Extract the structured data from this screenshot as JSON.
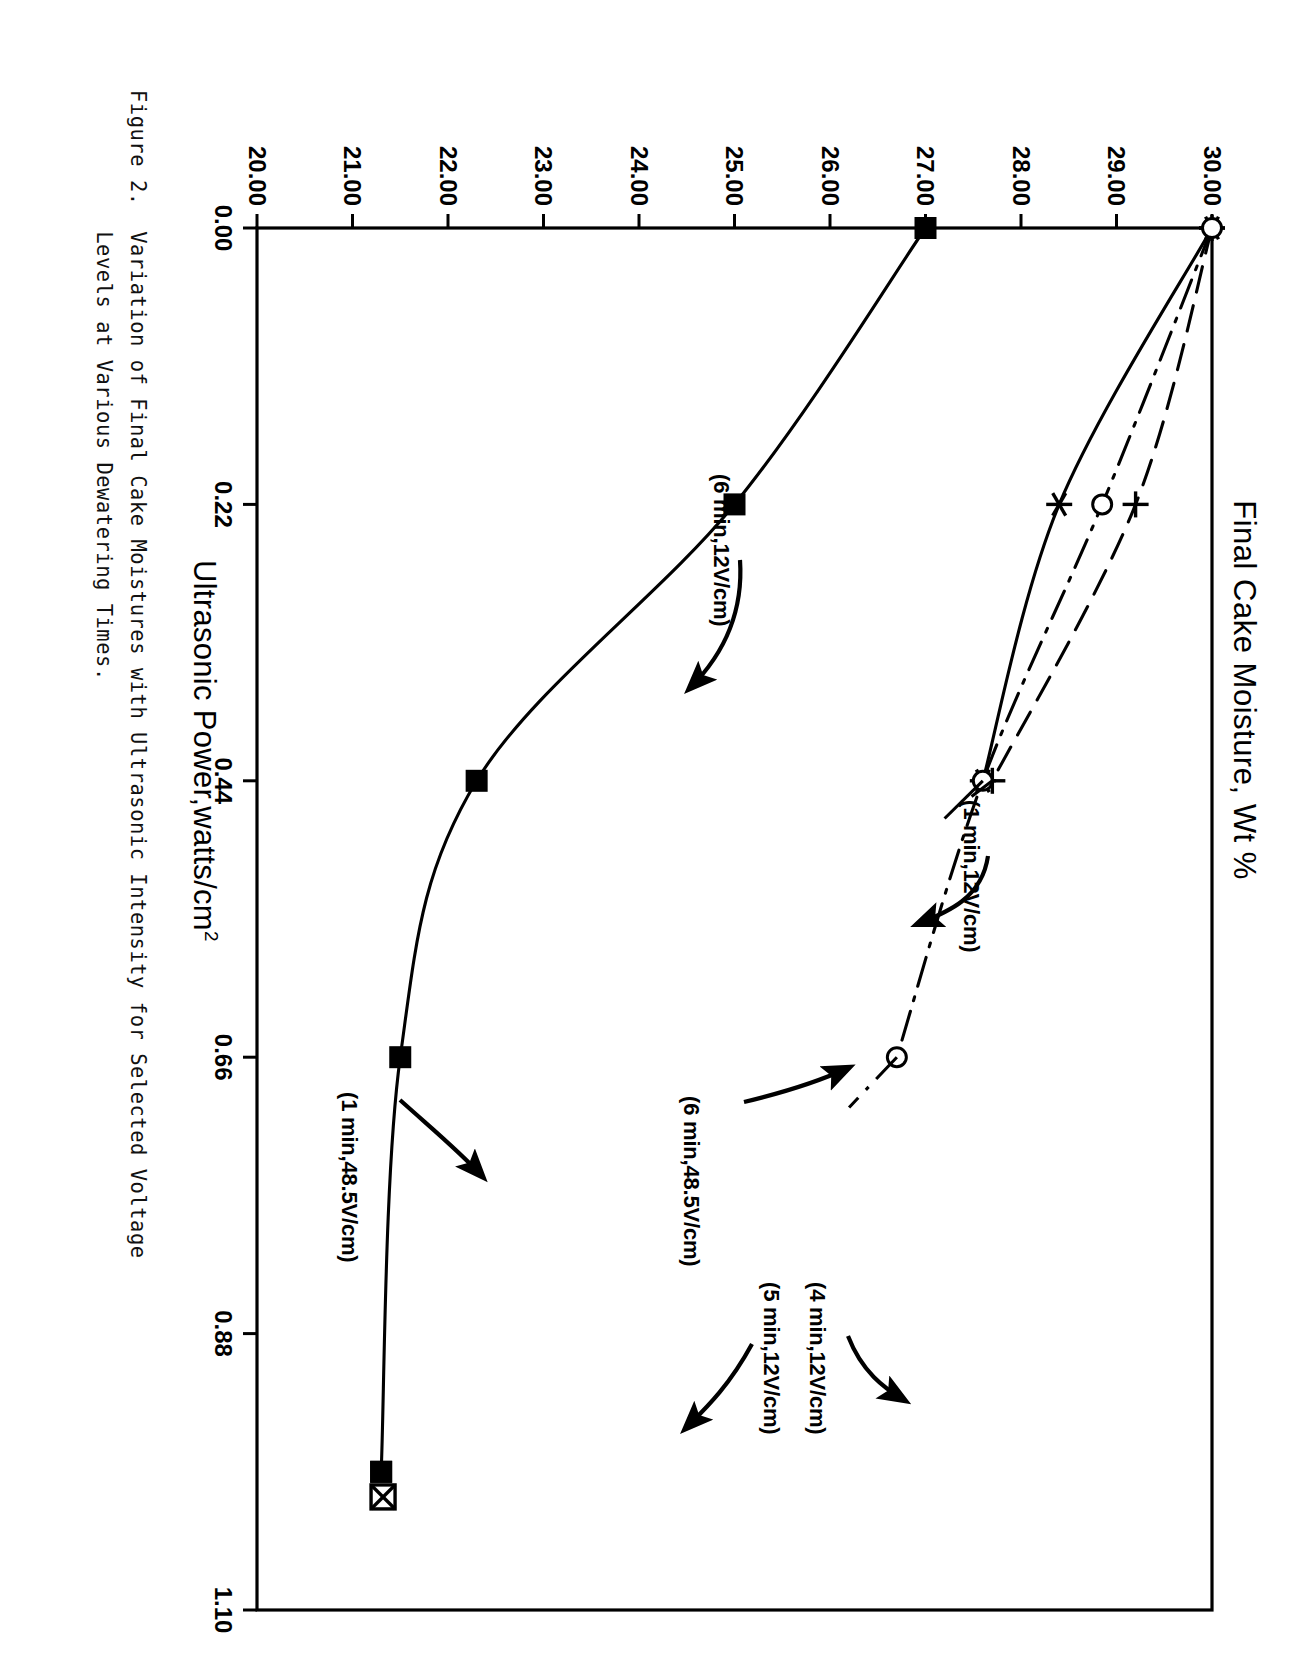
{
  "figure": {
    "caption_line1": "Figure 2.  Variation of Final Cake Moistures with Ultrasonic Intensity for Selected Voltage",
    "caption_line2": "           Levels at Various Dewatering Times."
  },
  "chart_data": {
    "type": "line",
    "title": "Final Cake Moisture, Wt %",
    "xlabel": "Ultrasonic Power,watts/cm",
    "xlabel_sup": "2",
    "ylabel": "Final Cake Moisture, Wt %",
    "xlim": [
      0.0,
      1.1
    ],
    "ylim": [
      20.0,
      30.0
    ],
    "grid": false,
    "legend": "inline-annotations",
    "xticks": [
      "0.00",
      "0.22",
      "0.44",
      "0.66",
      "0.88",
      "1.10"
    ],
    "xtick_values": [
      0.0,
      0.22,
      0.44,
      0.66,
      0.88,
      1.1
    ],
    "yticks": [
      "20.00",
      "21.00",
      "22.00",
      "23.00",
      "24.00",
      "25.00",
      "26.00",
      "27.00",
      "28.00",
      "29.00",
      "30.00"
    ],
    "ytick_values": [
      20,
      21,
      22,
      23,
      24,
      25,
      26,
      27,
      28,
      29,
      30
    ],
    "series": [
      {
        "name": "(6 min,12V/cm)",
        "marker": "filled-square",
        "linestyle": "solid",
        "x": [
          0.0,
          0.22,
          0.44,
          0.66,
          0.99
        ],
        "values": [
          27.0,
          25.0,
          22.3,
          21.5,
          21.3
        ]
      },
      {
        "name": "(1 min,12V/cm)",
        "marker": "asterisk",
        "linestyle": "solid",
        "x": [
          0.0,
          0.22,
          0.44
        ],
        "values": [
          30.0,
          28.4,
          27.6
        ]
      },
      {
        "name": "(6 min,48.5V/cm)",
        "marker": "plus",
        "linestyle": "dashed",
        "x": [
          0.0,
          0.22,
          0.44
        ],
        "values": [
          30.0,
          29.2,
          27.7
        ]
      },
      {
        "name": "(1 min,48.5V/cm)",
        "marker": "open-circle",
        "linestyle": "dash-dot",
        "x": [
          0.0,
          0.22,
          0.44,
          0.66
        ],
        "values": [
          30.0,
          28.85,
          27.6,
          26.7
        ]
      },
      {
        "name": "(4 min,12V/cm)",
        "marker": "filled-square",
        "linestyle": "none",
        "x": [
          0.99
        ],
        "values": [
          21.3
        ]
      },
      {
        "name": "(5 min,12V/cm)",
        "marker": "crossed-square",
        "linestyle": "none",
        "x": [
          1.01
        ],
        "values": [
          21.32
        ]
      }
    ],
    "annotations": [
      {
        "text": "(6 min,12V/cm)",
        "target_series": "(6 min,12V/cm)"
      },
      {
        "text": "(1 min,12V/cm)",
        "target_series": "(1 min,12V/cm)"
      },
      {
        "text": "(6 min,48.5V/cm)",
        "target_series": "(6 min,48.5V/cm)"
      },
      {
        "text": "(1 min,48.5V/cm)",
        "target_series": "(1 min,48.5V/cm)"
      },
      {
        "text": "(4 min,12V/cm)",
        "target_series": "(4 min,12V/cm)"
      },
      {
        "text": "(5 min,12V/cm)",
        "target_series": "(5 min,12V/cm)"
      }
    ]
  },
  "colors": {
    "ink": "#000000",
    "paper": "#ffffff"
  }
}
